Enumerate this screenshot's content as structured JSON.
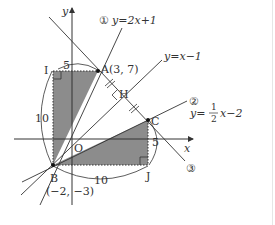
{
  "figure": {
    "axes": {
      "x_label": "x",
      "y_label": "y",
      "origin_label": "O"
    },
    "lines": [
      {
        "id": "line-1",
        "marker": "①",
        "equation": "y=2x+1"
      },
      {
        "id": "line-xm1",
        "equation": "y=x−1"
      },
      {
        "id": "line-2",
        "marker": "②",
        "equation_prefix": "y=",
        "fraction_num": "1",
        "fraction_den": "2",
        "equation_suffix": "x−2"
      },
      {
        "id": "line-3",
        "marker": "③"
      }
    ],
    "points": {
      "A": {
        "label": "A(3, 7)"
      },
      "B": {
        "label": "B",
        "coords": "(−2, −3)"
      },
      "C": {
        "label": "C"
      },
      "H": {
        "label": "H"
      },
      "I": {
        "label": "I"
      },
      "J": {
        "label": "J"
      }
    },
    "measures": {
      "IA": "5",
      "IB": "10",
      "BJ": "10",
      "JC": "5"
    },
    "colors": {
      "shade": "#8c8c8c",
      "line": "#333333"
    }
  }
}
